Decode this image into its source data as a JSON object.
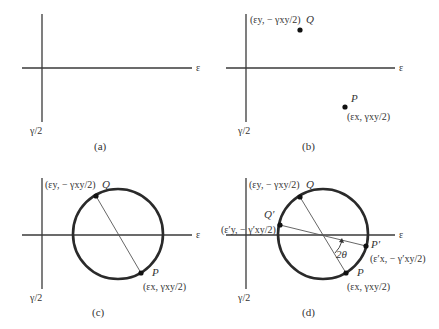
{
  "figure": {
    "axis_labels": {
      "horizontal": "ε",
      "vertical": "γ/2"
    },
    "panels": [
      {
        "id": "a",
        "caption": "(a)"
      },
      {
        "id": "b",
        "caption": "(b)",
        "points": [
          {
            "name": "Q",
            "coord_label": "(εy, − γxy/2)"
          },
          {
            "name": "P",
            "coord_label": "(εx, γxy/2)"
          }
        ]
      },
      {
        "id": "c",
        "caption": "(c)",
        "points": [
          {
            "name": "Q",
            "coord_label": "(εy, − γxy/2)"
          },
          {
            "name": "P",
            "coord_label": "(εx, γxy/2)"
          }
        ]
      },
      {
        "id": "d",
        "caption": "(d)",
        "points": [
          {
            "name": "Q",
            "coord_label": "(εy, − γxy/2)"
          },
          {
            "name": "Q′",
            "coord_label": "(ε′y, − γ′xy/2)"
          },
          {
            "name": "P′",
            "coord_label": "(ε′x, − γ′xy/2)"
          },
          {
            "name": "P",
            "coord_label": "(εx, γxy/2)"
          }
        ],
        "angle_label": "2θ"
      }
    ]
  }
}
